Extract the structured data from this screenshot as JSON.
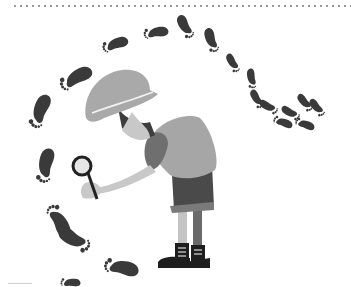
{
  "image": {
    "description": "Grayscale illustration of an explorer in a pith helmet bending over with a magnifying glass, surrounded by a curving trail of footprints",
    "colors": {
      "background": "#ffffff",
      "footprint": "#3a3a3a",
      "helmet": "#a9a9a9",
      "shirt": "#a6a6a6",
      "skin": "#c8c8c8",
      "hair": "#3d3d3d",
      "shorts": "#4a4a4a",
      "boots": "#1e1e1e",
      "border_dots": "#9a9a9a"
    },
    "elements": {
      "figure": "explorer",
      "tool": "magnifying-glass",
      "trail": "footprints",
      "footprint_count": 20
    }
  }
}
